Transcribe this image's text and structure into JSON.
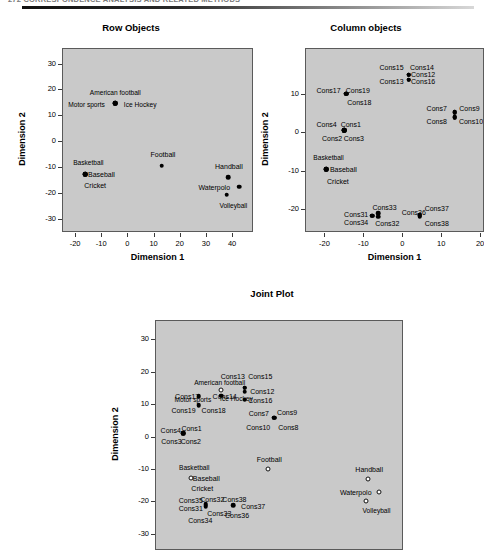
{
  "page": {
    "header_text": "272   CORRESPONDENCE ANALYSIS AND RELATED METHODS",
    "background": "#ffffff",
    "plot_background": "#c9c9c9"
  },
  "charts": [
    {
      "id": "row-objects",
      "title": "Row Objects",
      "xlabel": "Dimension 1",
      "ylabel": "Dimension 2"
    },
    {
      "id": "column-objects",
      "title": "Column objects",
      "xlabel": "Dimension 1",
      "ylabel": "Dimension 2"
    },
    {
      "id": "joint-plot",
      "title": "Joint Plot",
      "xlabel": "Dimension 1",
      "ylabel": "Dimension 2"
    }
  ],
  "chart_data": [
    {
      "type": "scatter",
      "id": "row-objects",
      "title": "Row Objects",
      "xlabel": "Dimension 1",
      "ylabel": "Dimension 2",
      "xlim": [
        -25,
        48
      ],
      "ylim": [
        -35,
        36
      ],
      "xticks": [
        -20,
        -10,
        0,
        10,
        20,
        30,
        40
      ],
      "yticks": [
        30,
        20,
        10,
        0,
        -10,
        -20,
        -30
      ],
      "grid": false,
      "legend": "none",
      "marker": "filled-circle",
      "points": [
        {
          "label": "American football",
          "x": -5,
          "y": 15,
          "label_dx": 0,
          "label_dy": 4.2
        },
        {
          "label": "Ice Hockey",
          "x": -5,
          "y": 15,
          "label_dx": 9.5,
          "label_dy": -0.6
        },
        {
          "label": "Motor sports",
          "x": -5,
          "y": 15,
          "label_dx": -11,
          "label_dy": -0.6
        },
        {
          "label": "Basketball",
          "x": -16.5,
          "y": -12.2,
          "label_dx": 1.2,
          "label_dy": 4.2
        },
        {
          "label": "Baseball",
          "x": -16.5,
          "y": -12.2,
          "label_dx": 6.2,
          "label_dy": 0
        },
        {
          "label": "Cricket",
          "x": -16.5,
          "y": -12.2,
          "label_dx": 3.8,
          "label_dy": -4.2
        },
        {
          "label": "Football",
          "x": 12.7,
          "y": -9.1,
          "label_dx": 0.5,
          "label_dy": 4.4
        },
        {
          "label": "Handball",
          "x": 38.2,
          "y": -13.4,
          "label_dx": 0.2,
          "label_dy": 4.4
        },
        {
          "label": "Waterpolo",
          "x": 42.3,
          "y": -17.1,
          "label_dx": -9.5,
          "label_dy": 0
        },
        {
          "label": "Volleyball",
          "x": 37.6,
          "y": -20.3,
          "label_dx": 2.5,
          "label_dy": -4.4
        }
      ]
    },
    {
      "type": "scatter",
      "id": "column-objects",
      "title": "Column objects",
      "xlabel": "Dimension 1",
      "ylabel": "Dimension 2",
      "xlim": [
        -25,
        21
      ],
      "ylim": [
        -26,
        22
      ],
      "xticks": [
        -20,
        -10,
        0,
        10,
        20
      ],
      "yticks": [
        10,
        0,
        -10,
        -20
      ],
      "grid": false,
      "legend": "none",
      "marker": "filled-circle",
      "points": [
        {
          "label": "Cons17",
          "x": -14.6,
          "y": 10.3,
          "label_dx": -4.6,
          "label_dy": 1.1
        },
        {
          "label": "Cons19",
          "x": -14.6,
          "y": 10.3,
          "label_dx": 2.9,
          "label_dy": 1.1
        },
        {
          "label": "Cons18",
          "x": -14.6,
          "y": 10.3,
          "label_dx": 3.3,
          "label_dy": -2.2
        },
        {
          "label": "Cons15",
          "x": 1.4,
          "y": 15.3,
          "label_dx": -4.4,
          "label_dy": 2.0
        },
        {
          "label": "Cons14",
          "x": 1.4,
          "y": 15.3,
          "label_dx": 3.4,
          "label_dy": 2.0
        },
        {
          "label": "Cons12",
          "x": 1.4,
          "y": 15.3,
          "label_dx": 3.7,
          "label_dy": 0.1
        },
        {
          "label": "Cons13",
          "x": 1.4,
          "y": 14.0,
          "label_dx": -4.4,
          "label_dy": -0.3
        },
        {
          "label": "Cons16",
          "x": 1.4,
          "y": 14.0,
          "label_dx": 3.7,
          "label_dy": -0.3
        },
        {
          "label": "Cons7",
          "x": 13.2,
          "y": 5.5,
          "label_dx": -4.6,
          "label_dy": 1.2
        },
        {
          "label": "Cons9",
          "x": 13.2,
          "y": 5.5,
          "label_dx": 3.8,
          "label_dy": 1.2
        },
        {
          "label": "Cons8",
          "x": 13.2,
          "y": 4.2,
          "label_dx": -4.6,
          "label_dy": -0.9
        },
        {
          "label": "Cons10",
          "x": 13.2,
          "y": 4.2,
          "label_dx": 4.2,
          "label_dy": -0.9
        },
        {
          "label": "Cons4",
          "x": -15.2,
          "y": 0.8,
          "label_dx": -4.5,
          "label_dy": 1.6
        },
        {
          "label": "Cons1",
          "x": -15.2,
          "y": 0.8,
          "label_dx": 1.7,
          "label_dy": 1.6
        },
        {
          "label": "Cons2",
          "x": -15.2,
          "y": 0.8,
          "label_dx": -3.1,
          "label_dy": -1.9
        },
        {
          "label": "Cons3",
          "x": -15.2,
          "y": 0.8,
          "label_dx": 2.5,
          "label_dy": -1.9
        },
        {
          "label": "Basketball",
          "x": -19.8,
          "y": -9.4,
          "label_dx": 0.6,
          "label_dy": 3.0
        },
        {
          "label": "Baseball",
          "x": -19.8,
          "y": -9.4,
          "label_dx": 4.4,
          "label_dy": 0
        },
        {
          "label": "Cricket",
          "x": -19.8,
          "y": -9.4,
          "label_dx": 3.0,
          "label_dy": -3.0
        },
        {
          "label": "Cons31",
          "x": -8.0,
          "y": -21.5,
          "label_dx": -4.1,
          "label_dy": 0.5
        },
        {
          "label": "Cons33",
          "x": -6.5,
          "y": -20.8,
          "label_dx": 1.7,
          "label_dy": 1.7
        },
        {
          "label": "Cons34",
          "x": -8.0,
          "y": -21.5,
          "label_dx": -4.1,
          "label_dy": -1.6
        },
        {
          "label": "Cons32",
          "x": -6.5,
          "y": -21.8,
          "label_dx": 2.4,
          "label_dy": -1.6
        },
        {
          "label": "Cons36",
          "x": 4.2,
          "y": -21.3,
          "label_dx": -1.5,
          "label_dy": 0.9
        },
        {
          "label": "Cons37",
          "x": 4.2,
          "y": -21.3,
          "label_dx": 4.4,
          "label_dy": 1.8
        },
        {
          "label": "Cons38",
          "x": 4.2,
          "y": -21.8,
          "label_dx": 4.4,
          "label_dy": -1.5
        }
      ]
    },
    {
      "type": "scatter",
      "id": "joint-plot",
      "title": "Joint Plot",
      "xlabel": "Dimension 1",
      "ylabel": "Dimension 2",
      "xlim": [
        -26,
        48
      ],
      "ylim": [
        -35,
        36
      ],
      "xticks": [],
      "yticks": [
        30,
        20,
        10,
        0,
        -10,
        -20,
        -30
      ],
      "grid": false,
      "legend": "none",
      "marker": "mixed",
      "note": "open circles = row objects (sports), filled circles = column objects (Cons items)",
      "points": [
        {
          "label": "Cons13",
          "x": 0.5,
          "y": 15.4,
          "marker": "filled",
          "label_dx": -3.6,
          "label_dy": 3.6
        },
        {
          "label": "Cons15",
          "x": 0.5,
          "y": 15.4,
          "marker": "filled",
          "label_dx": 4.6,
          "label_dy": 3.6
        },
        {
          "label": "American football",
          "x": -6.5,
          "y": 14.6,
          "marker": "open",
          "label_dx": -0.5,
          "label_dy": 2.2
        },
        {
          "label": "Cons12",
          "x": 0.5,
          "y": 14.2,
          "marker": "filled",
          "label_dx": 5.2,
          "label_dy": 0.2
        },
        {
          "label": "Cons17",
          "x": -13.2,
          "y": 12.7,
          "marker": "filled",
          "label_dx": -3.5,
          "label_dy": 0
        },
        {
          "label": "Cons14",
          "x": -6.5,
          "y": 13.0,
          "marker": "filled",
          "label_dx": 1.0,
          "label_dy": 0
        },
        {
          "label": "Ice Hockey",
          "x": -2.0,
          "y": 11.8,
          "marker": "none",
          "label_dx": 0,
          "label_dy": 0
        },
        {
          "label": "Cons16",
          "x": 0.5,
          "y": 11.7,
          "marker": "filled",
          "label_dx": 4.6,
          "label_dy": 0
        },
        {
          "label": "Motor sports",
          "x": -15.0,
          "y": 11.6,
          "marker": "none",
          "label_dx": 0,
          "label_dy": 0
        },
        {
          "label": "Cons19",
          "x": -13.2,
          "y": 10.0,
          "marker": "filled",
          "label_dx": -4.6,
          "label_dy": -1.5
        },
        {
          "label": "Cons18",
          "x": -13.2,
          "y": 10.0,
          "marker": "none",
          "label_dx": 4.4,
          "label_dy": -1.5
        },
        {
          "label": "Cons7",
          "x": 9.3,
          "y": 6.2,
          "marker": "filled",
          "label_dx": -4.6,
          "label_dy": 1.5
        },
        {
          "label": "Cons9",
          "x": 9.3,
          "y": 6.2,
          "marker": "filled",
          "label_dx": 3.8,
          "label_dy": 1.8
        },
        {
          "label": "Cons10",
          "x": 9.3,
          "y": 5.0,
          "marker": "none",
          "label_dx": -4.8,
          "label_dy": -1.8
        },
        {
          "label": "Cons8",
          "x": 9.3,
          "y": 5.0,
          "marker": "none",
          "label_dx": 4.2,
          "label_dy": -1.8
        },
        {
          "label": "Cons4",
          "x": -17.8,
          "y": 1.4,
          "marker": "filled",
          "label_dx": -3.8,
          "label_dy": 1.1
        },
        {
          "label": "Cons1",
          "x": -17.8,
          "y": 1.4,
          "marker": "filled",
          "label_dx": 2.4,
          "label_dy": 1.6
        },
        {
          "label": "Cons3",
          "x": -17.8,
          "y": 0.8,
          "marker": "none",
          "label_dx": -3.6,
          "label_dy": -1.9
        },
        {
          "label": "Cons2",
          "x": -17.8,
          "y": 0.8,
          "marker": "none",
          "label_dx": 2.2,
          "label_dy": -1.9
        },
        {
          "label": "Football",
          "x": 7.4,
          "y": -9.6,
          "marker": "open",
          "label_dx": 0.4,
          "label_dy": 3.1
        },
        {
          "label": "Basketball",
          "x": -15.6,
          "y": -12.4,
          "marker": "open",
          "label_dx": 1.0,
          "label_dy": 3.1
        },
        {
          "label": "Baseball",
          "x": -15.6,
          "y": -12.4,
          "marker": "none",
          "label_dx": 4.6,
          "label_dy": 0
        },
        {
          "label": "Cricket",
          "x": -15.6,
          "y": -12.4,
          "marker": "none",
          "label_dx": 3.4,
          "label_dy": -3.1
        },
        {
          "label": "Handball",
          "x": 37.4,
          "y": -12.7,
          "marker": "open",
          "label_dx": 0.2,
          "label_dy": 3.1
        },
        {
          "label": "Waterpolo",
          "x": 40.6,
          "y": -16.8,
          "marker": "open",
          "label_dx": -7.0,
          "label_dy": 0
        },
        {
          "label": "Volleyball",
          "x": 36.8,
          "y": -19.5,
          "marker": "open",
          "label_dx": 3.0,
          "label_dy": -3.1
        },
        {
          "label": "Cons32",
          "x": -11.2,
          "y": -20.6,
          "marker": "filled",
          "label_dx": 2.0,
          "label_dy": 1.8
        },
        {
          "label": "Cons35",
          "x": -11.2,
          "y": -21.2,
          "marker": "none",
          "label_dx": -4.4,
          "label_dy": 1.8
        },
        {
          "label": "Cons31",
          "x": -11.2,
          "y": -21.2,
          "marker": "filled",
          "label_dx": -4.4,
          "label_dy": -0.4
        },
        {
          "label": "Cons33",
          "x": -10.2,
          "y": -21.6,
          "marker": "none",
          "label_dx": 3.1,
          "label_dy": -1.8
        },
        {
          "label": "Cons34",
          "x": -11.2,
          "y": -21.2,
          "marker": "none",
          "label_dx": -1.6,
          "label_dy": -4.2
        },
        {
          "label": "Cons38",
          "x": -3.0,
          "y": -20.8,
          "marker": "filled",
          "label_dx": 0.4,
          "label_dy": 1.8
        },
        {
          "label": "Cons37",
          "x": -3.0,
          "y": -20.8,
          "marker": "none",
          "label_dx": 6.0,
          "label_dy": -0.4
        },
        {
          "label": "Cons36",
          "x": -3.0,
          "y": -21.6,
          "marker": "none",
          "label_dx": 1.2,
          "label_dy": -2.4
        }
      ]
    }
  ]
}
